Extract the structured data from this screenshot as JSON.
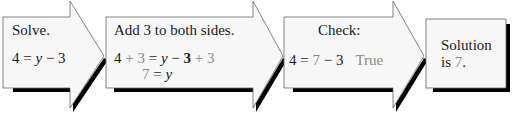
{
  "colors": {
    "fill": "#f7f7f7",
    "stroke": "#555555",
    "shadow": "#000000",
    "text": "#1a1a1a",
    "highlight": "#8a8a8a"
  },
  "steps": [
    {
      "title": "Solve.",
      "lines": [
        {
          "parts": [
            "4 = ",
            "y",
            " − 3"
          ]
        }
      ]
    },
    {
      "title": "Add 3 to both sides.",
      "line1": {
        "a": "4",
        "b": " + 3",
        "c": " = ",
        "d": "y",
        "e": " − ",
        "f": "3",
        "g": " + 3"
      },
      "line2": {
        "a": "7",
        "b": " = ",
        "c": "y"
      }
    },
    {
      "title": "Check:",
      "line": {
        "a": "4 = ",
        "b": "7",
        "c": " − 3",
        "d": "True"
      }
    },
    {
      "title": "Solution",
      "line2_a": "is ",
      "line2_b": "7",
      "line2_c": "."
    }
  ]
}
